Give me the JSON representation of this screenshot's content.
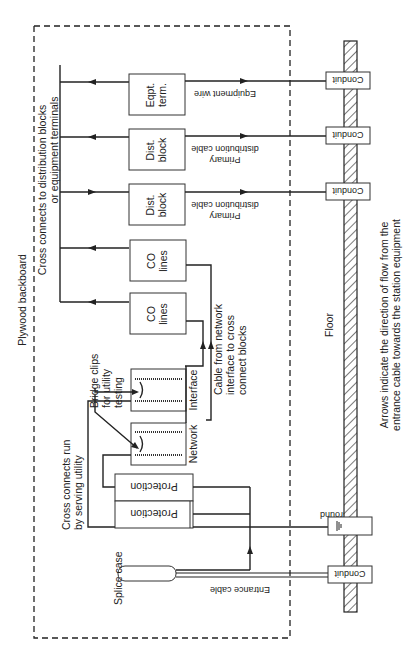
{
  "diagram": {
    "title": "Plywood backboard",
    "orientation": "rotated 90 degrees counter-clockwise",
    "backboard_label": "Plywood backboard",
    "floor_label": "Floor",
    "caption": {
      "line1": "Arrows indicate the direction of flow from the",
      "line2": "entrance cable towards the station equipment"
    },
    "top_annotation": {
      "line1": "Cross connects to distribution blocks",
      "line2": "or equipment terminals"
    },
    "blocks": [
      {
        "id": "eqpt-term",
        "line1": "Eqpt.",
        "line2": "term."
      },
      {
        "id": "dist-block-1",
        "line1": "Dist.",
        "line2": "block"
      },
      {
        "id": "dist-block-2",
        "line1": "Dist.",
        "line2": "block"
      },
      {
        "id": "co-lines-1",
        "line1": "CO",
        "line2": "lines"
      },
      {
        "id": "co-lines-2",
        "line1": "CO",
        "line2": "lines"
      }
    ],
    "interface_label": "Interface",
    "network_label": "Network",
    "protection_labels": [
      "Protection",
      "Protection"
    ],
    "bridge_clips": {
      "line1": "Bridge clips",
      "line2": "for utility",
      "line3": "testing"
    },
    "cross_connects_run": {
      "line1": "Cross connects run",
      "line2": "by serving utility"
    },
    "cable_from_network": {
      "line1": "Cable from network",
      "line2": "interface to cross",
      "line3": "connect blocks"
    },
    "splice_case": "Splice case",
    "entrance_cable": "Entrance cable",
    "ground": "Ground",
    "wires": {
      "equipment_wire": "Equipment wire",
      "primary_distribution_1": {
        "line1": "Primary",
        "line2": "distribution cable"
      },
      "primary_distribution_2": {
        "line1": "Primary",
        "line2": "distribution cable"
      }
    },
    "conduits": [
      "Conduit",
      "Conduit",
      "Conduit",
      "Conduit"
    ]
  }
}
